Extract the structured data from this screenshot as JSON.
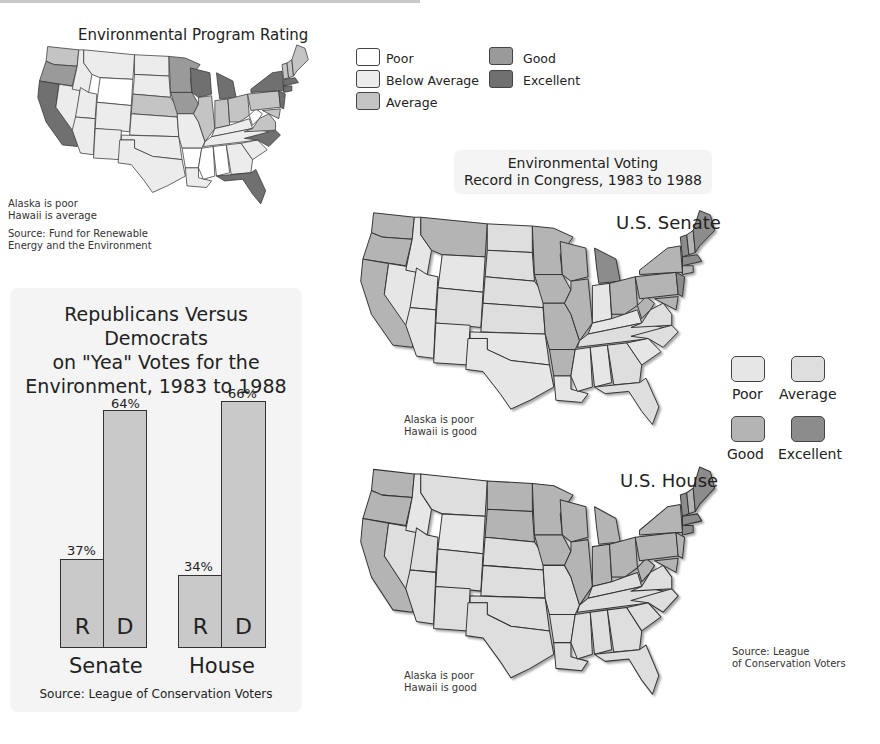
{
  "colors": {
    "poor": "#ffffff",
    "below_average": "#ececec",
    "average": "#c4c4c4",
    "good": "#9a9a9a",
    "excellent": "#707070",
    "v_poor": "#e6e6e6",
    "v_average": "#dedede",
    "v_good": "#b4b4b4",
    "v_excellent": "#8c8c8c"
  },
  "program_map": {
    "title": "Environmental Program Rating",
    "note_line1": "Alaska is poor",
    "note_line2": "Hawaii is average",
    "source_line1": "Source: Fund for Renewable",
    "source_line2": "Energy and the Environment",
    "states": {
      "WA": "average",
      "OR": "good",
      "CA": "excellent",
      "NV": "below_average",
      "ID": "below_average",
      "MT": "below_average",
      "WY": "poor",
      "UT": "below_average",
      "CO": "below_average",
      "AZ": "below_average",
      "NM": "below_average",
      "ND": "below_average",
      "SD": "below_average",
      "NE": "average",
      "KS": "below_average",
      "OK": "below_average",
      "TX": "below_average",
      "MN": "good",
      "IA": "good",
      "MO": "below_average",
      "AR": "poor",
      "LA": "below_average",
      "WI": "excellent",
      "IL": "average",
      "MI": "excellent",
      "IN": "average",
      "OH": "average",
      "KY": "below_average",
      "TN": "below_average",
      "MS": "poor",
      "AL": "poor",
      "GA": "below_average",
      "FL": "excellent",
      "SC": "below_average",
      "NC": "excellent",
      "VA": "average",
      "WV": "poor",
      "PA": "average",
      "NY": "excellent",
      "NJ": "excellent",
      "MD": "average",
      "ME": "average",
      "VT": "average",
      "NH": "average",
      "MA": "excellent",
      "CT": "excellent"
    }
  },
  "program_legend": [
    {
      "key": "poor",
      "label": "Poor"
    },
    {
      "key": "below_average",
      "label": "Below Average"
    },
    {
      "key": "average",
      "label": "Average"
    },
    {
      "key": "good",
      "label": "Good"
    },
    {
      "key": "excellent",
      "label": "Excellent"
    }
  ],
  "chart_data": {
    "type": "bar",
    "title": "Republicans Versus Democrats on \"Yea\" Votes for the Environment, 1983 to 1988",
    "title_line1": "Republicans Versus Democrats",
    "title_line2": "on \"Yea\" Votes for the",
    "title_line3": "Environment, 1983 to 1988",
    "categories": [
      "Senate",
      "House"
    ],
    "series": [
      {
        "name": "R",
        "values": [
          37,
          34
        ]
      },
      {
        "name": "D",
        "values": [
          64,
          66
        ]
      }
    ],
    "labels": {
      "senate_r": "37%",
      "senate_d": "64%",
      "house_r": "34%",
      "house_d": "66%"
    },
    "xlabel": "",
    "ylabel": "",
    "ylim": [
      0,
      70
    ],
    "source": "Source: League of Conservation Voters",
    "grid": false
  },
  "voting": {
    "title_line1": "Environmental Voting",
    "title_line2": "Record in Congress, 1983 to 1988",
    "legend": [
      {
        "key": "v_poor",
        "label": "Poor"
      },
      {
        "key": "v_average",
        "label": "Average"
      },
      {
        "key": "v_good",
        "label": "Good"
      },
      {
        "key": "v_excellent",
        "label": "Excellent"
      }
    ],
    "senate": {
      "title": "U.S. Senate",
      "note_line1": "Alaska is poor",
      "note_line2": "Hawaii is good",
      "states": {
        "WA": "v_good",
        "OR": "v_good",
        "CA": "v_good",
        "NV": "v_poor",
        "ID": "v_poor",
        "MT": "v_good",
        "WY": "v_poor",
        "UT": "v_poor",
        "CO": "v_average",
        "AZ": "v_poor",
        "NM": "v_poor",
        "ND": "v_average",
        "SD": "v_average",
        "NE": "v_average",
        "KS": "v_average",
        "OK": "v_poor",
        "TX": "v_poor",
        "MN": "v_good",
        "IA": "v_good",
        "MO": "v_good",
        "AR": "v_good",
        "LA": "v_poor",
        "WI": "v_good",
        "IL": "v_good",
        "MI": "v_excellent",
        "IN": "v_poor",
        "OH": "v_good",
        "KY": "v_poor",
        "TN": "v_average",
        "MS": "v_poor",
        "AL": "v_poor",
        "GA": "v_average",
        "FL": "v_average",
        "SC": "v_poor",
        "NC": "v_average",
        "VA": "v_average",
        "WV": "v_good",
        "PA": "v_good",
        "NY": "v_good",
        "NJ": "v_excellent",
        "MD": "v_good",
        "ME": "v_excellent",
        "VT": "v_excellent",
        "NH": "v_good",
        "MA": "v_excellent",
        "CT": "v_good"
      }
    },
    "house": {
      "title": "U.S. House",
      "note_line1": "Alaska is poor",
      "note_line2": "Hawaii is good",
      "source_line1": "Source: League",
      "source_line2": "of Conservation Voters",
      "states": {
        "WA": "v_good",
        "OR": "v_good",
        "CA": "v_good",
        "NV": "v_average",
        "ID": "v_poor",
        "MT": "v_average",
        "WY": "v_poor",
        "UT": "v_average",
        "CO": "v_average",
        "AZ": "v_average",
        "NM": "v_average",
        "ND": "v_good",
        "SD": "v_good",
        "NE": "v_average",
        "KS": "v_average",
        "OK": "v_average",
        "TX": "v_average",
        "MN": "v_good",
        "IA": "v_good",
        "MO": "v_average",
        "AR": "v_average",
        "LA": "v_average",
        "WI": "v_good",
        "IL": "v_good",
        "MI": "v_good",
        "IN": "v_good",
        "OH": "v_good",
        "KY": "v_average",
        "TN": "v_average",
        "MS": "v_average",
        "AL": "v_average",
        "GA": "v_average",
        "FL": "v_average",
        "SC": "v_average",
        "NC": "v_average",
        "VA": "v_average",
        "WV": "v_good",
        "PA": "v_good",
        "NY": "v_good",
        "NJ": "v_good",
        "MD": "v_good",
        "ME": "v_excellent",
        "VT": "v_excellent",
        "NH": "v_good",
        "MA": "v_excellent",
        "CT": "v_excellent"
      }
    }
  }
}
